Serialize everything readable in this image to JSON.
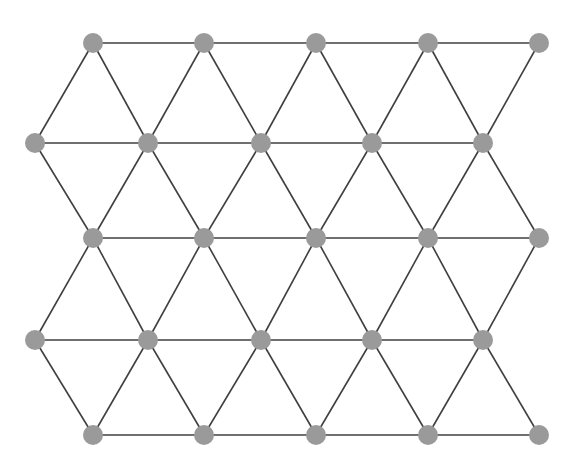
{
  "figure": {
    "background_color": "#ffffff",
    "width": 576,
    "height": 472
  },
  "style": {
    "node_fill": "#9a9a9a",
    "node_radius": 10,
    "edge_color": "#3f3f3f",
    "edge_width": 1.6
  },
  "graph": {
    "node_count": 25,
    "edge_count": 58,
    "row_count": 5,
    "nodes_per_row": 5,
    "nodes": [
      {
        "id": "r0c0",
        "row": 0,
        "col": 0,
        "x": 93,
        "y": 43
      },
      {
        "id": "r0c1",
        "row": 0,
        "col": 1,
        "x": 204,
        "y": 43
      },
      {
        "id": "r0c2",
        "row": 0,
        "col": 2,
        "x": 316,
        "y": 43
      },
      {
        "id": "r0c3",
        "row": 0,
        "col": 3,
        "x": 428,
        "y": 43
      },
      {
        "id": "r0c4",
        "row": 0,
        "col": 4,
        "x": 539,
        "y": 43
      },
      {
        "id": "r1c0",
        "row": 1,
        "col": 0,
        "x": 35,
        "y": 143
      },
      {
        "id": "r1c1",
        "row": 1,
        "col": 1,
        "x": 148,
        "y": 143
      },
      {
        "id": "r1c2",
        "row": 1,
        "col": 2,
        "x": 261,
        "y": 143
      },
      {
        "id": "r1c3",
        "row": 1,
        "col": 3,
        "x": 372,
        "y": 143
      },
      {
        "id": "r1c4",
        "row": 1,
        "col": 4,
        "x": 483,
        "y": 143
      },
      {
        "id": "r2c0",
        "row": 2,
        "col": 0,
        "x": 93,
        "y": 238
      },
      {
        "id": "r2c1",
        "row": 2,
        "col": 1,
        "x": 204,
        "y": 238
      },
      {
        "id": "r2c2",
        "row": 2,
        "col": 2,
        "x": 316,
        "y": 238
      },
      {
        "id": "r2c3",
        "row": 2,
        "col": 3,
        "x": 428,
        "y": 238
      },
      {
        "id": "r2c4",
        "row": 2,
        "col": 4,
        "x": 539,
        "y": 238
      },
      {
        "id": "r3c0",
        "row": 3,
        "col": 0,
        "x": 35,
        "y": 340
      },
      {
        "id": "r3c1",
        "row": 3,
        "col": 1,
        "x": 148,
        "y": 340
      },
      {
        "id": "r3c2",
        "row": 3,
        "col": 2,
        "x": 261,
        "y": 340
      },
      {
        "id": "r3c3",
        "row": 3,
        "col": 3,
        "x": 372,
        "y": 340
      },
      {
        "id": "r3c4",
        "row": 3,
        "col": 4,
        "x": 483,
        "y": 340
      },
      {
        "id": "r4c0",
        "row": 4,
        "col": 0,
        "x": 93,
        "y": 435
      },
      {
        "id": "r4c1",
        "row": 4,
        "col": 1,
        "x": 204,
        "y": 435
      },
      {
        "id": "r4c2",
        "row": 4,
        "col": 2,
        "x": 316,
        "y": 435
      },
      {
        "id": "r4c3",
        "row": 4,
        "col": 3,
        "x": 428,
        "y": 435
      },
      {
        "id": "r4c4",
        "row": 4,
        "col": 4,
        "x": 539,
        "y": 435
      }
    ],
    "edges": [
      [
        "r0c0",
        "r0c1"
      ],
      [
        "r0c1",
        "r0c2"
      ],
      [
        "r0c2",
        "r0c3"
      ],
      [
        "r0c3",
        "r0c4"
      ],
      [
        "r1c0",
        "r1c1"
      ],
      [
        "r1c1",
        "r1c2"
      ],
      [
        "r1c2",
        "r1c3"
      ],
      [
        "r1c3",
        "r1c4"
      ],
      [
        "r2c0",
        "r2c1"
      ],
      [
        "r2c1",
        "r2c2"
      ],
      [
        "r2c2",
        "r2c3"
      ],
      [
        "r2c3",
        "r2c4"
      ],
      [
        "r3c0",
        "r3c1"
      ],
      [
        "r3c1",
        "r3c2"
      ],
      [
        "r3c2",
        "r3c3"
      ],
      [
        "r3c3",
        "r3c4"
      ],
      [
        "r4c0",
        "r4c1"
      ],
      [
        "r4c1",
        "r4c2"
      ],
      [
        "r4c2",
        "r4c3"
      ],
      [
        "r4c3",
        "r4c4"
      ],
      [
        "r0c0",
        "r1c0"
      ],
      [
        "r0c0",
        "r1c1"
      ],
      [
        "r0c1",
        "r1c1"
      ],
      [
        "r0c1",
        "r1c2"
      ],
      [
        "r0c2",
        "r1c2"
      ],
      [
        "r0c2",
        "r1c3"
      ],
      [
        "r0c3",
        "r1c3"
      ],
      [
        "r0c3",
        "r1c4"
      ],
      [
        "r0c4",
        "r1c4"
      ],
      [
        "r1c0",
        "r2c0"
      ],
      [
        "r1c1",
        "r2c0"
      ],
      [
        "r1c1",
        "r2c1"
      ],
      [
        "r1c2",
        "r2c1"
      ],
      [
        "r1c2",
        "r2c2"
      ],
      [
        "r1c3",
        "r2c2"
      ],
      [
        "r1c3",
        "r2c3"
      ],
      [
        "r1c4",
        "r2c3"
      ],
      [
        "r1c4",
        "r2c4"
      ],
      [
        "r2c0",
        "r3c0"
      ],
      [
        "r2c0",
        "r3c1"
      ],
      [
        "r2c1",
        "r3c1"
      ],
      [
        "r2c1",
        "r3c2"
      ],
      [
        "r2c2",
        "r3c2"
      ],
      [
        "r2c2",
        "r3c3"
      ],
      [
        "r2c3",
        "r3c3"
      ],
      [
        "r2c3",
        "r3c4"
      ],
      [
        "r2c4",
        "r3c4"
      ],
      [
        "r3c0",
        "r4c0"
      ],
      [
        "r3c1",
        "r4c0"
      ],
      [
        "r3c1",
        "r4c1"
      ],
      [
        "r3c2",
        "r4c1"
      ],
      [
        "r3c2",
        "r4c2"
      ],
      [
        "r3c3",
        "r4c2"
      ],
      [
        "r3c3",
        "r4c3"
      ],
      [
        "r3c4",
        "r4c3"
      ],
      [
        "r3c4",
        "r4c4"
      ]
    ]
  }
}
